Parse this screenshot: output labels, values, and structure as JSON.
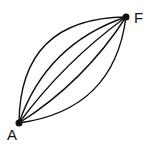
{
  "diagram": {
    "nodes": [
      {
        "id": "A",
        "label": "A",
        "x": 19,
        "y": 123
      },
      {
        "id": "F",
        "label": "F",
        "x": 126,
        "y": 17
      }
    ],
    "edges": [
      {
        "from": "A",
        "to": "F",
        "cx": 20,
        "cy": 18
      },
      {
        "from": "A",
        "to": "F",
        "cx": 46,
        "cy": 44
      },
      {
        "from": "A",
        "to": "F",
        "cx": 64,
        "cy": 62
      },
      {
        "from": "A",
        "to": "F",
        "cx": 84,
        "cy": 82
      },
      {
        "from": "A",
        "to": "F",
        "cx": 114,
        "cy": 110
      }
    ],
    "color": "#111111"
  }
}
